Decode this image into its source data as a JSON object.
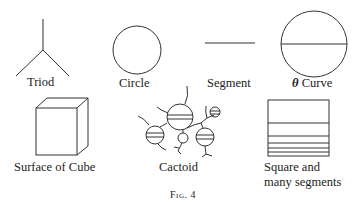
{
  "figure": {
    "caption": "Fig. 4",
    "items": [
      {
        "id": "triod",
        "label": "Triod"
      },
      {
        "id": "circle",
        "label": "Circle"
      },
      {
        "id": "segment",
        "label": "Segment"
      },
      {
        "id": "theta-curve",
        "symbol": "θ",
        "label": "Curve"
      },
      {
        "id": "surface-of-cube",
        "label": "Surface of Cube"
      },
      {
        "id": "cactoid",
        "label": "Cactoid"
      },
      {
        "id": "square-and-many-segments",
        "label_line1": "Square and",
        "label_line2": "many segments"
      }
    ]
  }
}
